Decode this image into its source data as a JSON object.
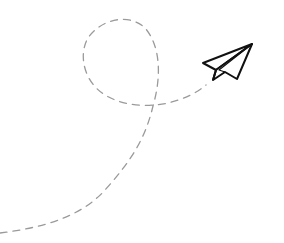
{
  "illustration": {
    "subject": "paper airplane with dashed looping flight path",
    "colors": {
      "background": "#ffffff",
      "trail": "#9a9a9a",
      "plane_outline": "#111111",
      "plane_fill": "#ffffff"
    },
    "trail": {
      "style": "dashed",
      "dash": "7 6",
      "stroke_width": 1.3
    },
    "plane": {
      "icon": "paper-plane-icon",
      "stroke_width": 2
    }
  }
}
